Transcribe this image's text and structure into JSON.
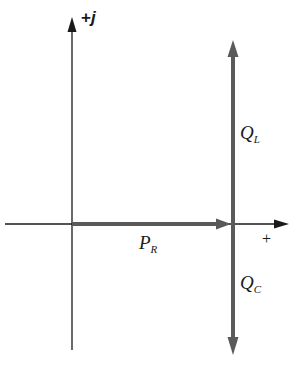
{
  "diagram": {
    "type": "phasor-diagram",
    "axes": {
      "imag_label_prefix": "+",
      "imag_label_var": "j",
      "real_label": "+"
    },
    "phasors": [
      {
        "name": "P",
        "sub": "R",
        "direction": "right",
        "color": "#5a5a5a"
      },
      {
        "name": "Q",
        "sub": "L",
        "direction": "up",
        "color": "#5a5a5a"
      },
      {
        "name": "Q",
        "sub": "C",
        "direction": "down",
        "color": "#5a5a5a"
      }
    ],
    "colors": {
      "axis": "#1a1a1a",
      "phasor": "#5a5a5a",
      "background": "#ffffff"
    }
  }
}
